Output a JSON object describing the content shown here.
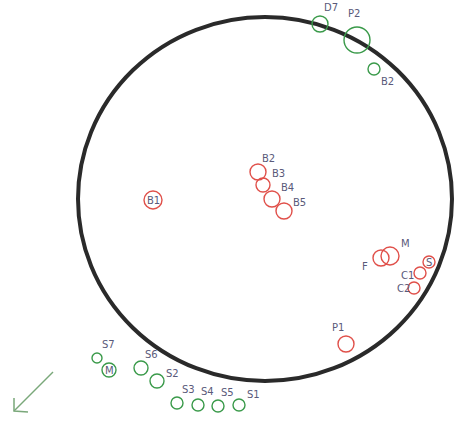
{
  "diagram": {
    "boundary": {
      "cx": 265,
      "cy": 199,
      "rx": 187,
      "ry": 182,
      "color": "#2a2a2a"
    },
    "colors": {
      "red": "#e0504a",
      "green": "#3a9a4a",
      "label": "#5a5a7a",
      "arrow": "#7aa87a"
    },
    "markers": [
      {
        "id": "D7",
        "label": "D7",
        "color": "green",
        "cx": 320,
        "cy": 24,
        "r": 8,
        "lx": 324,
        "ly": 11
      },
      {
        "id": "P2",
        "label": "P2",
        "color": "green",
        "cx": 357,
        "cy": 40,
        "r": 13,
        "lx": 348,
        "ly": 17
      },
      {
        "id": "B2-top",
        "label": "B2",
        "color": "green",
        "cx": 374,
        "cy": 69,
        "r": 6,
        "lx": 381,
        "ly": 85
      },
      {
        "id": "B1",
        "label": "B1",
        "color": "red",
        "cx": 153,
        "cy": 200,
        "r": 9,
        "lx": 147,
        "ly": 204,
        "inside": true
      },
      {
        "id": "B2",
        "label": "B2",
        "color": "red",
        "cx": 258,
        "cy": 172,
        "r": 8,
        "lx": 262,
        "ly": 162
      },
      {
        "id": "B3",
        "label": "B3",
        "color": "red",
        "cx": 263,
        "cy": 185,
        "r": 7,
        "lx": 272,
        "ly": 177
      },
      {
        "id": "B4",
        "label": "B4",
        "color": "red",
        "cx": 272,
        "cy": 199,
        "r": 8,
        "lx": 281,
        "ly": 191
      },
      {
        "id": "B5",
        "label": "B5",
        "color": "red",
        "cx": 284,
        "cy": 211,
        "r": 8,
        "lx": 293,
        "ly": 206
      },
      {
        "id": "F",
        "label": "F",
        "color": "red",
        "cx": 381,
        "cy": 258,
        "r": 8,
        "lx": 362,
        "ly": 270
      },
      {
        "id": "M",
        "label": "M",
        "color": "red",
        "cx": 390,
        "cy": 256,
        "r": 9,
        "lx": 401,
        "ly": 247
      },
      {
        "id": "S",
        "label": "S",
        "color": "red",
        "cx": 429,
        "cy": 262,
        "r": 6,
        "lx": 426,
        "ly": 266,
        "inside": true
      },
      {
        "id": "C1",
        "label": "C1",
        "color": "red",
        "cx": 420,
        "cy": 273,
        "r": 6,
        "lx": 401,
        "ly": 279
      },
      {
        "id": "C2",
        "label": "C2",
        "color": "red",
        "cx": 414,
        "cy": 288,
        "r": 6,
        "lx": 397,
        "ly": 292
      },
      {
        "id": "P1",
        "label": "P1",
        "color": "red",
        "cx": 346,
        "cy": 344,
        "r": 8,
        "lx": 332,
        "ly": 331
      },
      {
        "id": "S7",
        "label": "S7",
        "color": "green",
        "cx": 97,
        "cy": 358,
        "r": 5,
        "lx": 102,
        "ly": 348
      },
      {
        "id": "M-out",
        "label": "M",
        "color": "green",
        "cx": 109,
        "cy": 370,
        "r": 7,
        "lx": 105,
        "ly": 374,
        "inside": true
      },
      {
        "id": "S6",
        "label": "S6",
        "color": "green",
        "cx": 141,
        "cy": 368,
        "r": 7,
        "lx": 145,
        "ly": 358
      },
      {
        "id": "S2",
        "label": "S2",
        "color": "green",
        "cx": 157,
        "cy": 381,
        "r": 7,
        "lx": 166,
        "ly": 377
      },
      {
        "id": "S3",
        "label": "S3",
        "color": "green",
        "cx": 177,
        "cy": 403,
        "r": 6,
        "lx": 182,
        "ly": 393
      },
      {
        "id": "S4",
        "label": "S4",
        "color": "green",
        "cx": 198,
        "cy": 405,
        "r": 6,
        "lx": 201,
        "ly": 395
      },
      {
        "id": "S5",
        "label": "S5",
        "color": "green",
        "cx": 218,
        "cy": 406,
        "r": 6,
        "lx": 221,
        "ly": 396
      },
      {
        "id": "S1",
        "label": "S1",
        "color": "green",
        "cx": 239,
        "cy": 405,
        "r": 6,
        "lx": 247,
        "ly": 398
      }
    ],
    "arrow": {
      "x1": 53,
      "y1": 372,
      "x2": 14,
      "y2": 411,
      "direction": "south-west"
    }
  }
}
